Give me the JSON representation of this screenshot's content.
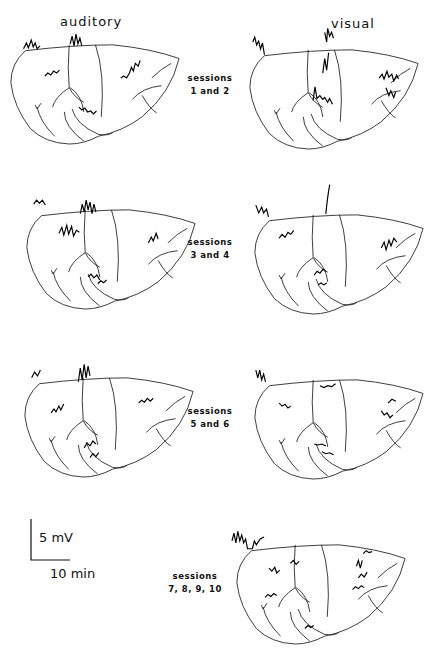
{
  "columns": {
    "left": "auditory",
    "right": "visual"
  },
  "sessions": [
    {
      "line1": "sessions",
      "line2": "1 and 2"
    },
    {
      "line1": "sessions",
      "line2": "3 and 4"
    },
    {
      "line1": "sessions",
      "line2": "5 and 6"
    },
    {
      "line1": "sessions",
      "line2": "7, 8, 9, 10"
    }
  ],
  "scale_bar": {
    "vertical": "5 mV",
    "horizontal": "10 min"
  },
  "colors": {
    "ink": "#111111",
    "background": "#ffffff"
  }
}
